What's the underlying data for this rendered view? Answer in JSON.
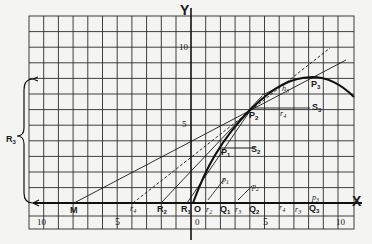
{
  "figure": {
    "axes": {
      "x_label": "X",
      "y_label": "Y"
    },
    "ticks": {
      "x_negative": [
        "10",
        "5"
      ],
      "x_origin": "0",
      "x_positive": [
        "5",
        "10"
      ],
      "y": [
        "10",
        "5"
      ]
    },
    "points": {
      "M": "M",
      "R2": "R",
      "R2_sub": "2",
      "R1": "R",
      "R1_sub": "1",
      "O": "O",
      "Q1": "Q",
      "Q1_sub": "1",
      "Q2": "Q",
      "Q2_sub": "2",
      "Q3": "Q",
      "Q3_sub": "3",
      "P1": "P",
      "P1_sub": "1",
      "P2": "P",
      "P2_sub": "2",
      "P3": "P",
      "P3_sub": "3",
      "S2": "S",
      "S2_sub": "2",
      "S3": "S",
      "S3_sub": "3",
      "R3_brace": "R",
      "R3_brace_sub": "3"
    },
    "small_labels": {
      "r4": "r",
      "r4_sub": "4",
      "r2": "r",
      "r2_sub": "2",
      "r3": "r",
      "r3_sub": "3",
      "r3b": "r",
      "r3b_sub": "3",
      "p1": "p",
      "p1_sub": "1",
      "p2": "p",
      "p2_sub": "2",
      "p3": "p",
      "p3_sub": "3",
      "r_mid": "r",
      "r_mid_sub": "4",
      "h_upper": "h",
      "h_upper_sub": "3"
    }
  },
  "colors": {
    "ink": "#1a1a1a",
    "paper": "#f4f4f2",
    "grid": "#2a2a2a"
  }
}
